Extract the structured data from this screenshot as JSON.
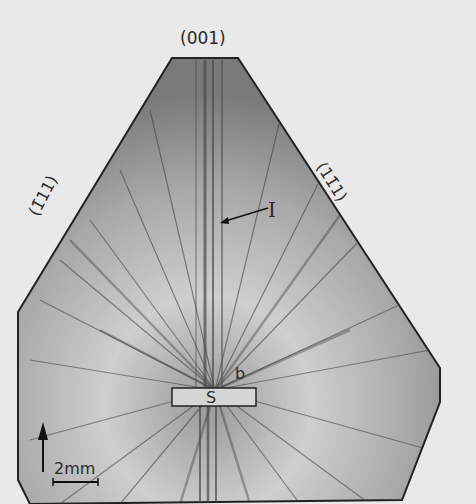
{
  "figure": {
    "face_labels": {
      "top": "(001)",
      "left": "(1̄11)",
      "right": "(11̄1)"
    },
    "markers": {
      "inclusion_line": "I",
      "seed": "S",
      "boundary": "b"
    },
    "scale_bar": "2mm",
    "colors": {
      "background": "#e9e9e9",
      "crystal_light": "#c8c8c8",
      "crystal_dark": "#3a3a3a",
      "text": "#2a2a2a"
    }
  }
}
